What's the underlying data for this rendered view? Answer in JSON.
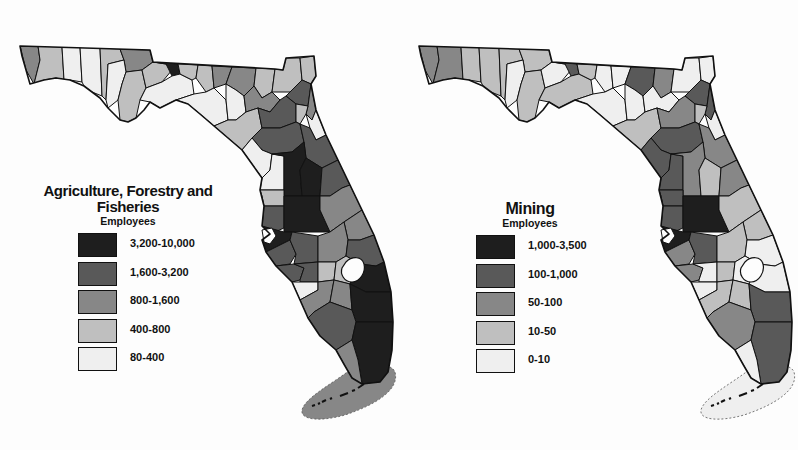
{
  "figure": {
    "class_colors": [
      "#1e1e1e",
      "#595959",
      "#878787",
      "#bfbfbf",
      "#efefef"
    ],
    "border_color": "#111111",
    "keys_outline_style": "dashed"
  },
  "maps": [
    {
      "id": "agriculture",
      "title_line1": "Agriculture, Forestry and",
      "title_line2": "Fisheries",
      "subtitle": "Employees",
      "legend": [
        {
          "label": "3,200-10,000",
          "class": 0
        },
        {
          "label": "1,600-3,200",
          "class": 1
        },
        {
          "label": "800-1,600",
          "class": 2
        },
        {
          "label": "400-800",
          "class": 3
        },
        {
          "label": "80-400",
          "class": 4
        }
      ],
      "keys_class": 2
    },
    {
      "id": "mining",
      "title_line1": "Mining",
      "title_line2": "",
      "subtitle": "Employees",
      "legend": [
        {
          "label": "1,000-3,500",
          "class": 0
        },
        {
          "label": "100-1,000",
          "class": 1
        },
        {
          "label": "50-100",
          "class": 2
        },
        {
          "label": "10-50",
          "class": 3
        },
        {
          "label": "0-10",
          "class": 4
        }
      ],
      "keys_class": 4
    }
  ],
  "chart_data": [
    {
      "type": "choropleth",
      "title": "Agriculture, Forestry and Fisheries Employees",
      "region": "Florida counties",
      "legend": [
        "3,200-10,000",
        "1,600-3,200",
        "800-1,600",
        "400-800",
        "80-400"
      ],
      "notes": "Darkest counties: central (Polk, Hillsborough, Lake, Orange area), southeast (Palm Beach, Broward, Dade), Jackson in panhandle. Monroe/Keys in 800-1,600."
    },
    {
      "type": "choropleth",
      "title": "Mining Employees",
      "region": "Florida counties",
      "legend": [
        "1,000-3,500",
        "100-1,000",
        "50-100",
        "10-50",
        "0-10"
      ],
      "notes": "Darkest counties: Polk and Hillsborough. Monroe/Keys in 0-10."
    }
  ]
}
